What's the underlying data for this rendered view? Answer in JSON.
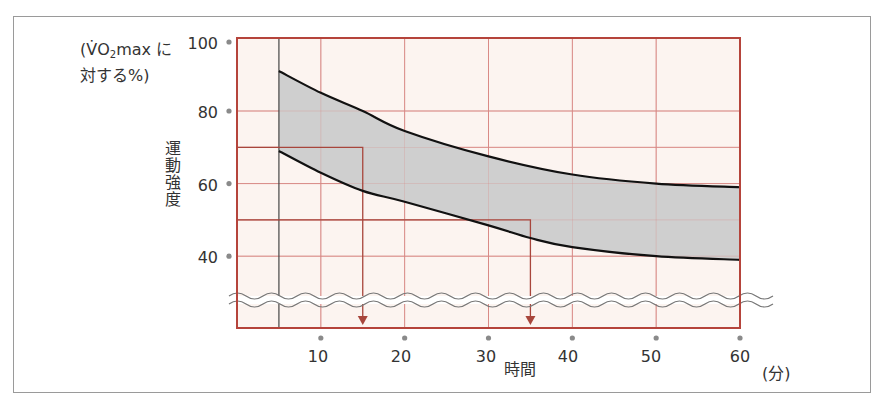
{
  "chart_data": {
    "type": "area",
    "title": "",
    "xlabel": "時間",
    "xunit": "(分)",
    "ylabel": "運動強度",
    "yunit_line1": "(VO2max に",
    "yunit_line2": "対する%)",
    "x_ticks": [
      10,
      20,
      30,
      40,
      50,
      60
    ],
    "y_ticks": [
      40,
      60,
      80,
      100
    ],
    "xlim": [
      0,
      60
    ],
    "ylim": [
      30,
      100
    ],
    "axis_break": "wavy break below 40%",
    "grid": true,
    "series": [
      {
        "name": "upper bound",
        "x": [
          5,
          10,
          15,
          20,
          30,
          40,
          50,
          60
        ],
        "values": [
          91,
          85,
          80,
          74.5,
          67.5,
          62.5,
          60,
          59
        ]
      },
      {
        "name": "lower bound",
        "x": [
          5,
          10,
          15,
          20,
          30,
          35,
          40,
          50,
          60
        ],
        "values": [
          69,
          63,
          58,
          55,
          48.5,
          45,
          42.5,
          40,
          39
        ]
      }
    ],
    "band_fill": "shaded region between upper and lower bounds",
    "annotations": [
      {
        "type": "reference-line",
        "from_y": 70,
        "to_x": 15,
        "arrow_down": true
      },
      {
        "type": "reference-line",
        "from_y": 50,
        "to_x": 35,
        "arrow_down": true
      },
      {
        "type": "vertical-line",
        "x": 5
      }
    ]
  },
  "labels": {
    "unit_open": "(",
    "unit_vo": "V̇O",
    "unit_sub": "2",
    "unit_rest": "max に",
    "unit_line2": "対する%)",
    "ylabel": "運動強度",
    "xlabel": "時間",
    "xunit": "(分)",
    "y100": "100",
    "y80": "80",
    "y60": "60",
    "y40": "40",
    "x10": "10",
    "x20": "20",
    "x30": "30",
    "x40": "40",
    "x50": "50",
    "x60": "60"
  },
  "colors": {
    "plot_bg": "#fcf4f0",
    "grid": "#d98a86",
    "border": "#b5443b",
    "band": "#cfcfcf",
    "curve": "#111111",
    "ref_line": "#a8463c",
    "dot": "#8a8a8a"
  }
}
